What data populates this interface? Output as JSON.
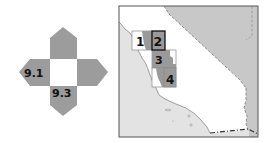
{
  "symbol": {
    "labels": {
      "left": "9.1",
      "bottom": "9.3"
    },
    "arrow_color": "#9c9c9c",
    "center_color": "#ffffff"
  },
  "map": {
    "land_color": "#ffffff",
    "ocean_color": "#e3e3e3",
    "neighbor_color": "#c8c8c8",
    "frame_color": "#555555",
    "index_boxes": [
      {
        "id": "1",
        "label": "1",
        "highlighted": false
      },
      {
        "id": "2",
        "label": "2",
        "highlighted": true
      },
      {
        "id": "3",
        "label": "3",
        "highlighted": false
      },
      {
        "id": "4",
        "label": "4",
        "highlighted": false
      }
    ],
    "box_fill": "#9a9a9a",
    "box_outline": "#888888",
    "highlight_outline": "#111111"
  }
}
